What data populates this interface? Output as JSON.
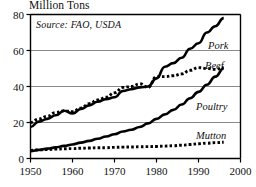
{
  "chart_data": {
    "type": "line",
    "title": "Million Tons",
    "subtitle": "Source: FAO, USDA",
    "xlabel": "",
    "ylabel": "Million Tons",
    "xlim": [
      1950,
      2000
    ],
    "ylim": [
      0,
      80
    ],
    "xticks": [
      1950,
      1960,
      1970,
      1980,
      1990,
      2000
    ],
    "yticks": [
      0,
      20,
      40,
      60,
      80
    ],
    "grid": "horizontal",
    "legend_position": "inline-right",
    "x": [
      1950,
      1952,
      1954,
      1956,
      1958,
      1960,
      1962,
      1964,
      1966,
      1968,
      1970,
      1972,
      1974,
      1976,
      1978,
      1980,
      1982,
      1984,
      1986,
      1988,
      1990,
      1992,
      1994,
      1996
    ],
    "series": [
      {
        "name": "Pork",
        "style": "solid",
        "color": "#000000",
        "values": [
          17.5,
          20.5,
          22.0,
          24.0,
          26.5,
          25.0,
          27.5,
          29.5,
          31.5,
          33.0,
          34.0,
          37.5,
          38.5,
          39.5,
          40.0,
          44.5,
          51.0,
          53.0,
          56.0,
          61.0,
          64.0,
          70.0,
          73.5,
          78.0
        ]
      },
      {
        "name": "Beef",
        "style": "dotted",
        "color": "#000000",
        "values": [
          20.0,
          22.0,
          23.5,
          25.5,
          26.5,
          26.0,
          28.0,
          30.5,
          32.5,
          34.0,
          36.5,
          39.5,
          40.0,
          41.5,
          39.5,
          45.5,
          45.5,
          46.0,
          47.0,
          49.0,
          50.5,
          50.0,
          49.5,
          50.5
        ]
      },
      {
        "name": "Poultry",
        "style": "solid",
        "color": "#000000",
        "values": [
          4.0,
          4.8,
          5.5,
          6.2,
          7.0,
          7.8,
          8.8,
          9.8,
          11.0,
          12.2,
          13.5,
          15.0,
          16.0,
          17.5,
          19.5,
          22.0,
          24.5,
          27.0,
          30.0,
          33.5,
          37.0,
          41.0,
          45.5,
          50.0
        ]
      },
      {
        "name": "Mutton",
        "style": "dotted",
        "color": "#000000",
        "values": [
          4.5,
          4.8,
          5.0,
          5.2,
          5.4,
          5.5,
          5.7,
          5.8,
          6.0,
          6.0,
          6.2,
          6.3,
          6.4,
          6.5,
          6.6,
          6.7,
          6.9,
          7.1,
          7.4,
          7.8,
          8.2,
          8.5,
          8.8,
          9.0
        ]
      }
    ],
    "series_label_positions": [
      {
        "name": "Pork",
        "x": 208,
        "y": 40
      },
      {
        "name": "Beef",
        "x": 205,
        "y": 60
      },
      {
        "name": "Poultry",
        "x": 196,
        "y": 101
      },
      {
        "name": "Mutton",
        "x": 196,
        "y": 130
      }
    ]
  }
}
